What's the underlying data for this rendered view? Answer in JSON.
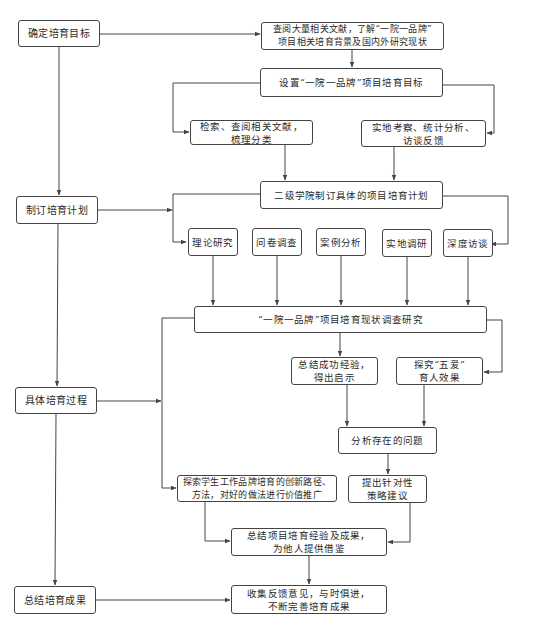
{
  "stages": [
    {
      "id": "s1",
      "label": "确定培育目标"
    },
    {
      "id": "s2",
      "label": "制订培育计划"
    },
    {
      "id": "s3",
      "label": "具体培育过程"
    },
    {
      "id": "s4",
      "label": "总结培育成果"
    }
  ],
  "nodes": {
    "lit_review": "查阅大量相关文献，了解“一院一品牌”\n项目相关培育背景及国内外研究现状",
    "set_goal": "设置“一院一品牌”项目培育目标",
    "search_classify": "检索、查阅相关文献，\n梳理分类",
    "field_stats": "实地考察、统计分析、\n访谈反馈",
    "plan": "二级学院制订具体的项目培育计划",
    "methods": [
      "理论研究",
      "问卷调查",
      "案例分析",
      "实地调研",
      "深度访谈"
    ],
    "status_research": "“一院一品牌”项目培育现状调查研究",
    "summarize_experience": "总结成功经验，\n得出启示",
    "explore_five_love": "探究“五爱”\n育人效果",
    "analyze_problems": "分析存在的问题",
    "explore_paths": "探索学生工作品牌培育的创新路径、\n方法，对好的做法进行价值推广",
    "propose_strategies": "提出针对性\n策略建议",
    "summarize_results": "总结项目培育经验及成果，\n为他人提供借鉴",
    "collect_feedback": "收集反馈意见，与时俱进，\n不断完善培育成果"
  },
  "colors": {
    "line": "#444444",
    "box_border": "#444444",
    "text": "#2a2a2a",
    "background": "#ffffff"
  }
}
